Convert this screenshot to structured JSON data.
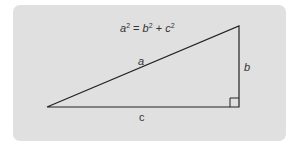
{
  "diagram": {
    "formula": {
      "lhs_var": "a",
      "lhs_exp": "2",
      "eq": " = ",
      "rhs1_var": "b",
      "rhs1_exp": "2",
      "plus": " + ",
      "rhs2_var": "c",
      "rhs2_exp": "2"
    },
    "labels": {
      "hypotenuse": "a",
      "vertical_leg": "b",
      "horizontal_leg": "c"
    },
    "colors": {
      "panel": "#e0e0e0",
      "lines": "#222222",
      "text": "#333333"
    }
  }
}
